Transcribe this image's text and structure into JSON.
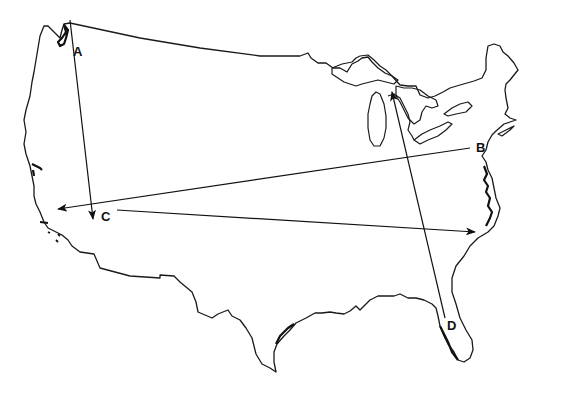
{
  "map": {
    "subject": "Outline map of the contiguous United States",
    "background_color": "#ffffff",
    "line_color": "#111111"
  },
  "labels": [
    {
      "id": "A",
      "text": "A",
      "x": 73,
      "y": 56
    },
    {
      "id": "B",
      "text": "B",
      "x": 476,
      "y": 152
    },
    {
      "id": "C",
      "text": "C",
      "x": 101,
      "y": 221
    },
    {
      "id": "D",
      "text": "D",
      "x": 447,
      "y": 330
    }
  ],
  "arrows": [
    {
      "id": "arrow-a",
      "label": "A",
      "from": [
        70,
        20
      ],
      "to": [
        93,
        219
      ],
      "direction": "north-to-south"
    },
    {
      "id": "arrow-b",
      "label": "B",
      "from": [
        470,
        148
      ],
      "to": [
        58,
        209
      ],
      "direction": "east-to-west"
    },
    {
      "id": "arrow-c",
      "label": "C",
      "from": [
        117,
        210
      ],
      "to": [
        475,
        232
      ],
      "direction": "west-to-east"
    },
    {
      "id": "arrow-d",
      "label": "D",
      "from": [
        445,
        318
      ],
      "to": [
        392,
        92
      ],
      "direction": "south-to-north"
    }
  ]
}
